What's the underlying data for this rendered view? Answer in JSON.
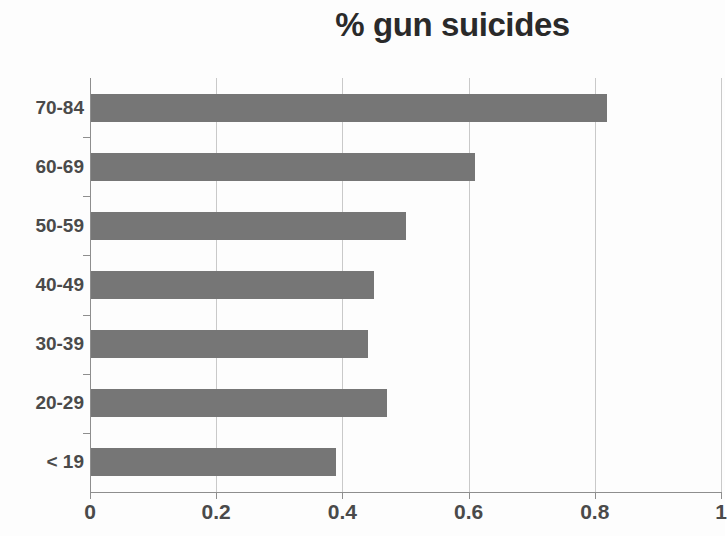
{
  "chart_data": {
    "type": "bar",
    "orientation": "horizontal",
    "title": "% gun suicides",
    "xlabel": "",
    "ylabel": "",
    "categories": [
      "< 19",
      "20-29",
      "30-39",
      "40-49",
      "50-59",
      "60-69",
      "70-84"
    ],
    "values": [
      0.39,
      0.47,
      0.44,
      0.45,
      0.5,
      0.61,
      0.82
    ],
    "xlim": [
      0,
      1
    ],
    "xticks": [
      0,
      0.2,
      0.4,
      0.6,
      0.8,
      1
    ],
    "xtick_labels": [
      "0",
      "0.2",
      "0.4",
      "0.6",
      "0.8",
      "1"
    ],
    "grid": "vertical",
    "legend": null,
    "bar_color": "#767676",
    "gridline_color": "#c9c9c9",
    "axis_color": "#8e8e8e",
    "text_color": "#4a4a4a",
    "title_color": "#2a2a2a",
    "background_color": "#fdfdfd"
  }
}
